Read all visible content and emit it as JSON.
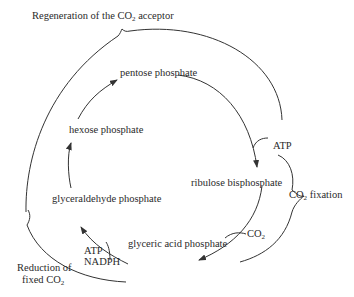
{
  "diagram": {
    "nodes": {
      "pentose": "pentose phosphate",
      "hexose": "hexose phosphate",
      "ribulose": "ribulose bisphosphate",
      "glyceraldehyde": "glyceraldehyde phosphate",
      "glyceric": "glyceric acid phosphate"
    },
    "inputs": {
      "atp_top": "ATP",
      "co2": "CO",
      "co2_sub": "2",
      "atp_bottom": "ATP",
      "nadph": "NADPH"
    },
    "phases": {
      "regeneration_pre": "Regeneration of the CO",
      "regeneration_sub": "2",
      "regeneration_post": " acceptor",
      "fixation_pre": "CO",
      "fixation_sub": "2",
      "fixation_post": " fixation",
      "reduction_line1": "Reduction of",
      "reduction_line2_pre": "fixed CO",
      "reduction_line2_sub": "2"
    },
    "colors": {
      "line": "#333333",
      "text": "#2a2a2a",
      "background": "#ffffff"
    }
  }
}
